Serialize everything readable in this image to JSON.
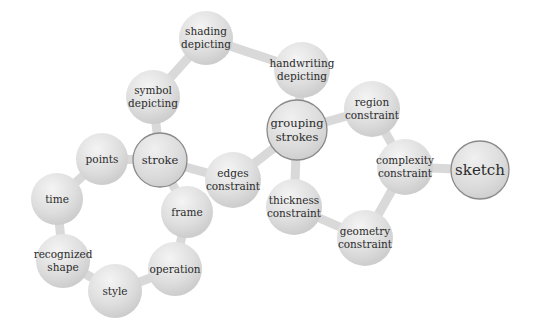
{
  "diagram": {
    "title": "",
    "colors": {
      "bubble_light": "#f2f2f2",
      "bubble_dark": "#cfcfcf",
      "connector": "#d9d9d9",
      "highlight_border": "#8a8a8a",
      "text": "#2b2b2b"
    },
    "nodes": [
      {
        "id": "sketch",
        "lines": [
          "sketch"
        ],
        "x": 480,
        "y": 170,
        "r": 29,
        "highlight": true,
        "size": 15
      },
      {
        "id": "complexity-constraint",
        "lines": [
          "complexity",
          "constraint"
        ],
        "x": 405,
        "y": 167,
        "r": 28,
        "highlight": false,
        "size": 10.5
      },
      {
        "id": "region-constraint",
        "lines": [
          "region",
          "constraint"
        ],
        "x": 372,
        "y": 109,
        "r": 28,
        "highlight": false,
        "size": 10.5
      },
      {
        "id": "geometry-constraint",
        "lines": [
          "geometry",
          "constraint"
        ],
        "x": 365,
        "y": 238,
        "r": 28,
        "highlight": false,
        "size": 10.5
      },
      {
        "id": "grouping-strokes",
        "lines": [
          "grouping",
          "strokes"
        ],
        "x": 297,
        "y": 130,
        "r": 30,
        "highlight": true,
        "size": 11.5
      },
      {
        "id": "handwriting-depicting",
        "lines": [
          "handwriting",
          "depicting"
        ],
        "x": 302,
        "y": 70,
        "r": 28,
        "highlight": false,
        "size": 10.5
      },
      {
        "id": "shading-depicting",
        "lines": [
          "shading",
          "depicting"
        ],
        "x": 206,
        "y": 38,
        "r": 27,
        "highlight": false,
        "size": 10.5
      },
      {
        "id": "symbol-depicting",
        "lines": [
          "symbol",
          "depicting"
        ],
        "x": 153,
        "y": 97,
        "r": 27,
        "highlight": false,
        "size": 10.5
      },
      {
        "id": "stroke",
        "lines": [
          "stroke"
        ],
        "x": 160,
        "y": 160,
        "r": 27,
        "highlight": true,
        "size": 11.5
      },
      {
        "id": "points",
        "lines": [
          "points"
        ],
        "x": 102,
        "y": 159,
        "r": 26,
        "highlight": false,
        "size": 10.5
      },
      {
        "id": "time",
        "lines": [
          "time"
        ],
        "x": 57,
        "y": 199,
        "r": 26,
        "highlight": false,
        "size": 10.5
      },
      {
        "id": "edges-constraint",
        "lines": [
          "edges",
          "constraint"
        ],
        "x": 233,
        "y": 180,
        "r": 28,
        "highlight": false,
        "size": 10.5
      },
      {
        "id": "thickness-constraint",
        "lines": [
          "thickness",
          "constraint"
        ],
        "x": 294,
        "y": 207,
        "r": 28,
        "highlight": false,
        "size": 10.5
      },
      {
        "id": "frame",
        "lines": [
          "frame"
        ],
        "x": 187,
        "y": 212,
        "r": 26,
        "highlight": false,
        "size": 10.5
      },
      {
        "id": "operation",
        "lines": [
          "operation"
        ],
        "x": 175,
        "y": 269,
        "r": 27,
        "highlight": false,
        "size": 10.5
      },
      {
        "id": "recognized-shape",
        "lines": [
          "recognized",
          "shape"
        ],
        "x": 63,
        "y": 261,
        "r": 27,
        "highlight": false,
        "size": 10.5
      },
      {
        "id": "style",
        "lines": [
          "style"
        ],
        "x": 115,
        "y": 291,
        "r": 27,
        "highlight": false,
        "size": 10.5
      }
    ],
    "edges": [
      [
        "sketch",
        "complexity-constraint"
      ],
      [
        "complexity-constraint",
        "region-constraint"
      ],
      [
        "complexity-constraint",
        "geometry-constraint"
      ],
      [
        "region-constraint",
        "grouping-strokes"
      ],
      [
        "geometry-constraint",
        "thickness-constraint"
      ],
      [
        "grouping-strokes",
        "handwriting-depicting"
      ],
      [
        "grouping-strokes",
        "thickness-constraint"
      ],
      [
        "grouping-strokes",
        "edges-constraint"
      ],
      [
        "handwriting-depicting",
        "shading-depicting"
      ],
      [
        "shading-depicting",
        "symbol-depicting"
      ],
      [
        "symbol-depicting",
        "stroke"
      ],
      [
        "stroke",
        "edges-constraint"
      ],
      [
        "stroke",
        "points"
      ],
      [
        "stroke",
        "frame"
      ],
      [
        "points",
        "time"
      ],
      [
        "time",
        "recognized-shape"
      ],
      [
        "recognized-shape",
        "style"
      ],
      [
        "style",
        "operation"
      ],
      [
        "operation",
        "frame"
      ]
    ]
  }
}
